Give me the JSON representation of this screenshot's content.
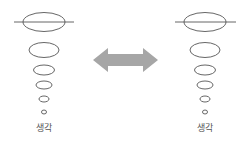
{
  "diagram": {
    "left_stack": {
      "label": "생각",
      "center_x": 44,
      "ellipses": [
        {
          "cy": 22,
          "rx": 21,
          "ry": 9.5
        },
        {
          "cy": 50,
          "rx": 15,
          "ry": 7.5
        },
        {
          "cy": 70,
          "rx": 10.5,
          "ry": 5
        },
        {
          "cy": 85,
          "rx": 8,
          "ry": 4
        },
        {
          "cy": 99,
          "rx": 5,
          "ry": 3
        },
        {
          "cy": 112,
          "rx": 2.5,
          "ry": 2
        }
      ],
      "line": {
        "x1": 14,
        "x2": 74,
        "y": 22
      }
    },
    "right_stack": {
      "label": "생각",
      "center_x": 205,
      "ellipses": [
        {
          "cy": 22,
          "rx": 21,
          "ry": 9.5
        },
        {
          "cy": 50,
          "rx": 15,
          "ry": 7.5
        },
        {
          "cy": 70,
          "rx": 10.5,
          "ry": 5
        },
        {
          "cy": 85,
          "rx": 8,
          "ry": 4
        },
        {
          "cy": 99,
          "rx": 5,
          "ry": 3
        },
        {
          "cy": 112,
          "rx": 2.5,
          "ry": 2
        }
      ],
      "line": {
        "x1": 175,
        "x2": 236,
        "y": 22
      }
    },
    "arrow": {
      "icon": "double-arrow-icon",
      "color": "#a6a6a6"
    },
    "colors": {
      "stroke": "#555555",
      "background": "#ffffff"
    }
  }
}
